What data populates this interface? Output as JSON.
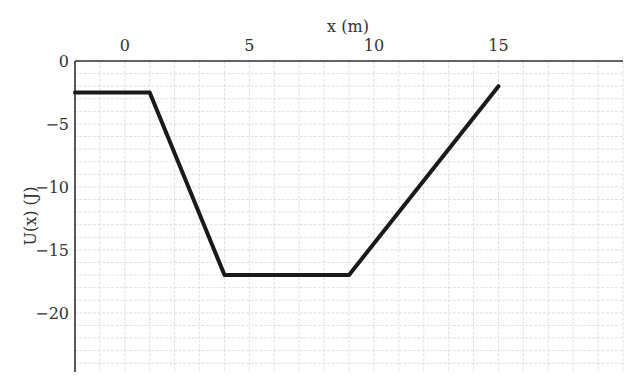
{
  "chart_data": {
    "type": "line",
    "title": "",
    "xlabel": "x (m)",
    "ylabel": "U(x) (J)",
    "xlim": [
      -2,
      20
    ],
    "ylim": [
      -24.7,
      0
    ],
    "x_ticks": [
      0,
      5,
      10,
      15
    ],
    "x_tick_labels": [
      "0",
      "5",
      "10",
      "15"
    ],
    "y_ticks": [
      0,
      -5,
      -10,
      -15,
      -20
    ],
    "y_tick_labels": [
      "0",
      "−5",
      "−10",
      "−15",
      "−20"
    ],
    "x_axis_position": "top",
    "grid": true,
    "grid_step": {
      "x": 1,
      "y": 1
    },
    "legend": null,
    "series": [
      {
        "name": "U(x)",
        "x": [
          -2,
          1,
          4,
          9,
          15
        ],
        "y": [
          -2.5,
          -2.5,
          -17,
          -17,
          -2
        ],
        "color": "#1a1a1a"
      }
    ]
  },
  "colors": {
    "line": "#1a1a1a",
    "axis": "#333333",
    "grid": "#d9d9d9",
    "background": "#ffffff"
  }
}
